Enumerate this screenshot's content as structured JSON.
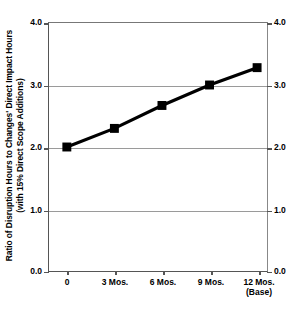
{
  "chart_data": {
    "type": "line",
    "title": "",
    "xlabel": "",
    "ylabel": "Ratio of Disruption Hours to Changes' Direct Impact Hours (with 15% Direct Scope Additions)",
    "ylabel_line1": "Ratio of Disruption Hours to Changes' Direct Impact Hours",
    "ylabel_line2": "(with 15% Direct Scope Additions)",
    "categories": [
      "0",
      "3 Mos.",
      "6 Mos.",
      "9 Mos.",
      "12 Mos. (Base)"
    ],
    "values": [
      2.0,
      2.3,
      2.67,
      3.0,
      3.28
    ],
    "ylim": [
      0.0,
      4.0
    ],
    "ytick_values": [
      0.0,
      1.0,
      2.0,
      3.0,
      4.0
    ],
    "ytick_labels_left": [
      "0.0",
      "1.0",
      "2.0",
      "3.0",
      "4.0"
    ],
    "ytick_labels_right": [
      "0.0",
      "1.0",
      "2.0",
      "3.0",
      "4.0"
    ],
    "gridline_values": [
      1.0,
      2.0,
      3.0
    ],
    "grid": true,
    "legend": "none",
    "series_color": "#000000",
    "grid_color": "#9a9a9a",
    "axis_color": "#555555",
    "marker": "square",
    "dual_y_axis": true
  },
  "xticks": [
    {
      "label": "0",
      "sub": ""
    },
    {
      "label": "3 Mos.",
      "sub": ""
    },
    {
      "label": "6 Mos.",
      "sub": ""
    },
    {
      "label": "9 Mos.",
      "sub": ""
    },
    {
      "label": "12 Mos.",
      "sub": "(Base)"
    }
  ],
  "yticks_left": [
    {
      "label": "4.0"
    },
    {
      "label": "3.0"
    },
    {
      "label": "2.0"
    },
    {
      "label": "1.0"
    },
    {
      "label": "0.0"
    }
  ],
  "yticks_right": [
    {
      "label": "4.0"
    },
    {
      "label": "3.0"
    },
    {
      "label": "2.0"
    },
    {
      "label": "1.0"
    },
    {
      "label": "0.0"
    }
  ]
}
